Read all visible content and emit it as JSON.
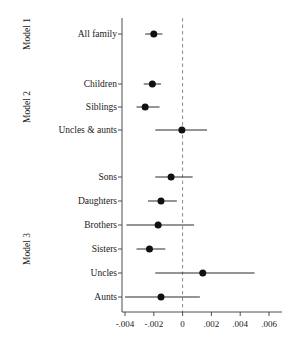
{
  "figure": {
    "groups": [
      {
        "name": "Model 1"
      },
      {
        "name": "Model 2"
      },
      {
        "name": "Model 3"
      }
    ]
  },
  "chart_data": {
    "type": "scatter",
    "title": "",
    "xlabel": "",
    "ylabel": "",
    "xlim": [
      -0.005,
      0.0065
    ],
    "xticks": [
      -0.004,
      -0.002,
      0,
      0.002,
      0.004,
      0.006
    ],
    "xticklabels": [
      "-.004",
      "-.002",
      "0",
      ".002",
      ".004",
      ".006"
    ],
    "grid": false,
    "legend": "none",
    "reference_line": {
      "value": 0,
      "style": "dashed",
      "color": "#8a8a8a"
    },
    "categories": [
      "All family",
      "Children",
      "Siblings",
      "Uncles & aunts",
      "Sons",
      "Daughters",
      "Brothers",
      "Sisters",
      "Uncles",
      "Aunts"
    ],
    "series": [
      {
        "name": "Estimate with 95% CI",
        "points": [
          {
            "label": "All family",
            "group": "Model 1",
            "estimate": -0.002,
            "ci_low": -0.0026,
            "ci_high": -0.0014
          },
          {
            "label": "Children",
            "group": "Model 2",
            "estimate": -0.0021,
            "ci_low": -0.0027,
            "ci_high": -0.0015
          },
          {
            "label": "Siblings",
            "group": "Model 2",
            "estimate": -0.0026,
            "ci_low": -0.0032,
            "ci_high": -0.0016
          },
          {
            "label": "Uncles & aunts",
            "group": "Model 2",
            "estimate": -5e-05,
            "ci_low": -0.0019,
            "ci_high": 0.0017
          },
          {
            "label": "Sons",
            "group": "Model 3",
            "estimate": -0.0008,
            "ci_low": -0.0019,
            "ci_high": 0.0007
          },
          {
            "label": "Daughters",
            "group": "Model 3",
            "estimate": -0.0015,
            "ci_low": -0.0024,
            "ci_high": -0.0004
          },
          {
            "label": "Brothers",
            "group": "Model 3",
            "estimate": -0.0017,
            "ci_low": -0.0039,
            "ci_high": 0.0008
          },
          {
            "label": "Sisters",
            "group": "Model 3",
            "estimate": -0.0023,
            "ci_low": -0.0032,
            "ci_high": -0.0012
          },
          {
            "label": "Uncles",
            "group": "Model 3",
            "estimate": 0.0014,
            "ci_low": -0.0019,
            "ci_high": 0.005
          },
          {
            "label": "Aunts",
            "group": "Model 3",
            "estimate": -0.0015,
            "ci_low": -0.004,
            "ci_high": 0.0012
          }
        ]
      }
    ]
  }
}
